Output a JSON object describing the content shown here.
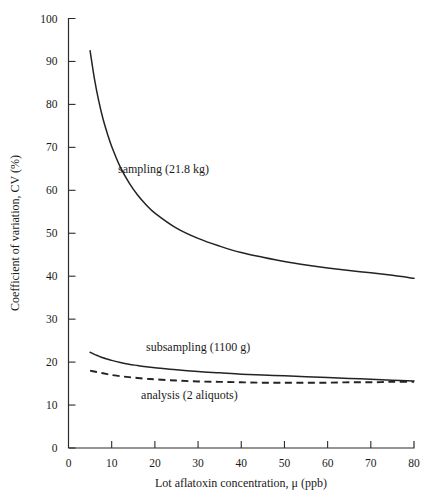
{
  "chart_data": {
    "type": "line",
    "title": "",
    "xlabel": "Lot aflatoxin concentration, μ (ppb)",
    "ylabel": "Coefficient of variation, CV (%)",
    "xlim": [
      0,
      80
    ],
    "ylim": [
      0,
      100
    ],
    "xticks": [
      0,
      10,
      20,
      30,
      40,
      50,
      60,
      70,
      80
    ],
    "yticks": [
      0,
      10,
      20,
      30,
      40,
      50,
      60,
      70,
      80,
      90,
      100
    ],
    "xtick_labels": [
      "0",
      "10",
      "20",
      "30",
      "40",
      "50",
      "60",
      "70",
      "80"
    ],
    "ytick_labels": [
      "0",
      "10",
      "20",
      "30",
      "40",
      "50",
      "60",
      "70",
      "80",
      "90",
      "100"
    ],
    "grid": false,
    "legend_position": "inline-annotations",
    "x": [
      5,
      6,
      7,
      8,
      9,
      10,
      12,
      14,
      16,
      18,
      20,
      25,
      30,
      35,
      40,
      45,
      50,
      55,
      60,
      65,
      70,
      75,
      80
    ],
    "series": [
      {
        "name": "sampling (21.8 kg)",
        "style": "solid",
        "label_x": 22,
        "label_y": 64,
        "values": [
          92.5,
          86.0,
          80.8,
          76.6,
          73.2,
          70.2,
          65.4,
          61.8,
          58.9,
          56.6,
          54.7,
          51.2,
          48.8,
          47.0,
          45.5,
          44.4,
          43.4,
          42.6,
          41.9,
          41.3,
          40.8,
          40.2,
          39.5
        ]
      },
      {
        "name": "subsampling (1100 g)",
        "style": "solid",
        "label_x": 30,
        "label_y": 22.5,
        "values": [
          22.3,
          21.8,
          21.4,
          21.0,
          20.7,
          20.4,
          19.9,
          19.5,
          19.2,
          18.9,
          18.7,
          18.2,
          17.8,
          17.5,
          17.2,
          17.0,
          16.8,
          16.6,
          16.4,
          16.2,
          16.0,
          15.8,
          15.6
        ]
      },
      {
        "name": "analysis (2 aliquots)",
        "style": "dashed",
        "label_x": 28,
        "label_y": 11.5,
        "values": [
          18.0,
          17.8,
          17.6,
          17.4,
          17.2,
          17.0,
          16.7,
          16.5,
          16.3,
          16.1,
          16.0,
          15.7,
          15.5,
          15.4,
          15.3,
          15.2,
          15.2,
          15.2,
          15.2,
          15.3,
          15.3,
          15.4,
          15.4
        ]
      }
    ]
  },
  "colors": {
    "axis": "#2b2b2b",
    "curve": "#232323",
    "background": "#ffffff"
  },
  "annotations": {
    "sampling": "sampling (21.8 kg)",
    "subsampling": "subsampling (1100 g)",
    "analysis": "analysis (2 aliquots)"
  }
}
